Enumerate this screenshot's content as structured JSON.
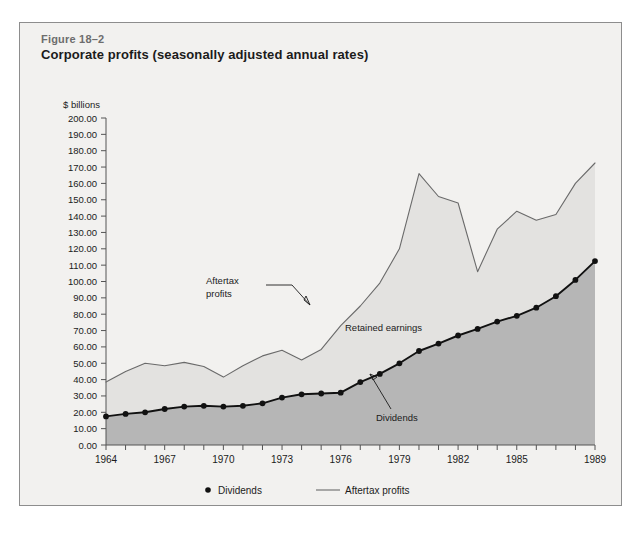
{
  "figure": {
    "number": "Figure 18–2",
    "title": "Corporate profits (seasonally adjusted annual rates)"
  },
  "colors": {
    "card_background": "#f2f1ef",
    "card_border": "#8d8d8d",
    "retained_area": "#e3e2e0",
    "dividends_area": "#b6b6b6",
    "aftertax_line": "#6a6a6a",
    "dividends_line": "#111111",
    "axis": "#545454",
    "text": "#1b1b1b",
    "figure_number_text": "#6d6d6d"
  },
  "annotations": [
    {
      "name": "aftertax-profits-callout",
      "line1": "Aftertax",
      "line2": "profits"
    },
    {
      "name": "retained-earnings-label",
      "line1": "Retained earnings",
      "line2": ""
    },
    {
      "name": "dividends-callout",
      "line1": "Dividends",
      "line2": ""
    }
  ],
  "legend": {
    "position": "bottom-center",
    "items": [
      {
        "label": "Dividends",
        "marker": "dot",
        "color": "#111111"
      },
      {
        "label": "Aftertax profits",
        "marker": "line",
        "color": "#6a6a6a"
      }
    ]
  },
  "chart_data": {
    "type": "line",
    "title": "Corporate profits (seasonally adjusted annual rates)",
    "xlabel": "",
    "ylabel": "$ billions",
    "ylim": [
      0,
      200
    ],
    "ytick_step": 10,
    "ytick_labels": [
      "0.00",
      "10.00",
      "20.00",
      "30.00",
      "40.00",
      "50.00",
      "60.00",
      "70.00",
      "80.00",
      "90.00",
      "100.00",
      "110.00",
      "120.00",
      "130.00",
      "140.00",
      "150.00",
      "160.00",
      "170.00",
      "180.00",
      "190.00",
      "200.00"
    ],
    "xlim": [
      1964,
      1989
    ],
    "xtick_step": 1,
    "xtick_labels_shown": [
      "1964",
      "1967",
      "1970",
      "1973",
      "1976",
      "1979",
      "1982",
      "1985",
      "1989"
    ],
    "grid": false,
    "legend_position": "bottom-center",
    "x": [
      1964,
      1965,
      1966,
      1967,
      1968,
      1969,
      1970,
      1971,
      1972,
      1973,
      1974,
      1975,
      1976,
      1977,
      1978,
      1979,
      1980,
      1981,
      1982,
      1983,
      1984,
      1985,
      1986,
      1987,
      1988,
      1989
    ],
    "series": [
      {
        "name": "Aftertax profits",
        "style": "line",
        "color": "#6a6a6a",
        "values": [
          38.5,
          45.0,
          50.0,
          48.5,
          50.5,
          48.0,
          41.5,
          48.5,
          54.5,
          58.0,
          52.0,
          58.5,
          73.0,
          85.0,
          99.0,
          120.0,
          166.0,
          152.0,
          148.0,
          106.0,
          132.0,
          143.0,
          137.5,
          141.0,
          160.0,
          172.5
        ]
      },
      {
        "name": "Dividends",
        "style": "line-markers",
        "color": "#111111",
        "marker": "dot",
        "values": [
          17.5,
          19.0,
          20.0,
          22.0,
          23.5,
          24.0,
          23.5,
          24.0,
          25.5,
          29.0,
          31.0,
          31.5,
          32.0,
          38.5,
          43.5,
          50.0,
          57.5,
          62.0,
          67.0,
          71.0,
          75.5,
          79.0,
          84.0,
          91.0,
          101.0,
          112.5
        ]
      }
    ],
    "note": "Area between the two lines is labeled Retained earnings; area below the dividends line is shaded darker."
  }
}
